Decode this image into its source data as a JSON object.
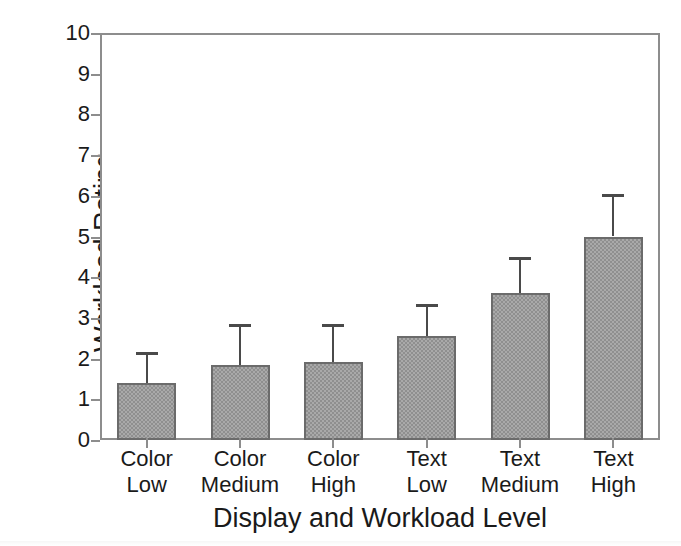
{
  "chart_data": {
    "type": "bar",
    "title": "",
    "xlabel": "Display and Workload Level",
    "ylabel": "Workload Rating",
    "categories": [
      "Color Low",
      "Color Medium",
      "Color High",
      "Text Low",
      "Text Medium",
      "Text High"
    ],
    "category_lines": [
      [
        "Color",
        "Low"
      ],
      [
        "Color",
        "Medium"
      ],
      [
        "Color",
        "High"
      ],
      [
        "Text",
        "Low"
      ],
      [
        "Text",
        "Medium"
      ],
      [
        "Text",
        "High"
      ]
    ],
    "values": [
      1.4,
      1.85,
      1.92,
      2.55,
      3.6,
      5.0
    ],
    "error_upper": [
      0.75,
      1.0,
      0.92,
      0.8,
      0.9,
      1.05
    ],
    "error_bar_tops": [
      2.15,
      2.85,
      2.84,
      3.35,
      4.5,
      6.05
    ],
    "ylim": [
      0,
      10
    ],
    "ytick_labels": [
      "0",
      "1",
      "2",
      "3",
      "4",
      "5",
      "6",
      "7",
      "8",
      "9",
      "10"
    ],
    "ytick_values": [
      0,
      1,
      2,
      3,
      4,
      5,
      6,
      7,
      8,
      9,
      10
    ],
    "grid": false,
    "legend": null,
    "bar_fill_color": "#a9a9a9",
    "bar_edge_color": "#6b6b6b",
    "error_bar_color": "#4a4a4a",
    "axis_color": "#8d8d8d",
    "text_color": "#1a1a1a",
    "background_color": "#ffffff"
  }
}
